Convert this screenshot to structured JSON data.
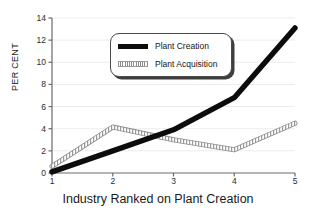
{
  "chart_data": {
    "type": "line",
    "title": "",
    "xlabel": "Industry Ranked on Plant Creation",
    "ylabel": "PER CENT",
    "x": [
      1,
      2,
      3,
      4,
      5
    ],
    "xtick_labels": [
      "1",
      "2",
      "3",
      "4",
      "5"
    ],
    "ytick_labels": [
      "0",
      "2",
      "4",
      "6",
      "8",
      "10",
      "12",
      "14"
    ],
    "yticks": [
      0,
      2,
      4,
      6,
      8,
      10,
      12,
      14
    ],
    "xlim": [
      1,
      5
    ],
    "ylim": [
      0,
      14
    ],
    "grid": "horizontal-faint",
    "legend_position": "upper-center-left",
    "series": [
      {
        "name": "Plant Creation",
        "values": [
          0.1,
          2.0,
          3.9,
          6.8,
          13.1
        ],
        "style": "solid-thick-black",
        "color": "#0c0c0c"
      },
      {
        "name": "Plant Acquisition",
        "values": [
          0.6,
          4.15,
          3.0,
          2.1,
          4.5
        ],
        "style": "hatched-outline-gray",
        "color": "#8d8d8d"
      }
    ]
  },
  "legend": {
    "items": [
      {
        "label": "Plant Creation"
      },
      {
        "label": "Plant Acquisition"
      }
    ]
  },
  "axes": {
    "y_axis_label": "PER CENT",
    "x_axis_label": "Industry Ranked on Plant Creation"
  },
  "colors": {
    "creation": "#0c0c0c",
    "acquisition": "#8d8d8d",
    "axis": "#6a6a6a",
    "grid": "#ececed",
    "background": "#ffffff"
  }
}
